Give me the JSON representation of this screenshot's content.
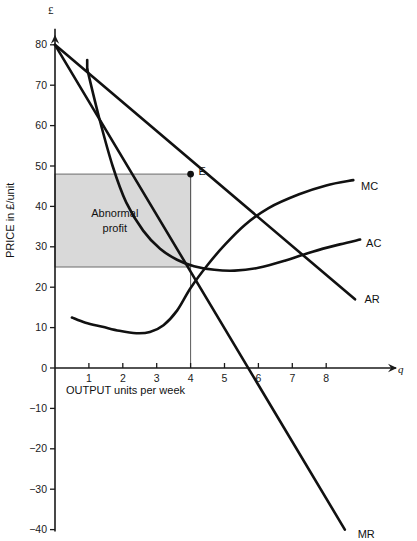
{
  "chart_data": {
    "type": "line",
    "title": "",
    "xlabel": "OUTPUT units per week",
    "ylabel": "PRICE in £/unit",
    "x_axis_symbol": "q",
    "y_axis_symbol": "£",
    "xlim": [
      0,
      9.2
    ],
    "ylim": [
      -40,
      82
    ],
    "grid": false,
    "legend_position": "right-of-curve-ends",
    "x_ticks": [
      1,
      2,
      3,
      4,
      5,
      6,
      7,
      8
    ],
    "x_tick_labels": [
      "1",
      "2",
      "3",
      "4",
      "5",
      "6",
      "7",
      "8"
    ],
    "y_ticks": [
      80,
      70,
      60,
      50,
      40,
      30,
      20,
      10,
      0,
      -10,
      -20,
      -30,
      -40
    ],
    "y_tick_labels": [
      "80",
      "70",
      "60",
      "50",
      "40",
      "30",
      "20",
      "10",
      "0",
      "−10",
      "−20",
      "−30",
      "−40"
    ],
    "series": [
      {
        "name": "AR",
        "label": "AR",
        "label_x": 8.95,
        "label_y": 17,
        "type": "line",
        "points": [
          [
            0,
            80
          ],
          [
            8.85,
            17
          ]
        ]
      },
      {
        "name": "MR",
        "label": "MR",
        "label_x": 8.75,
        "label_y": -41,
        "type": "line",
        "points": [
          [
            0,
            80
          ],
          [
            8.55,
            -40
          ]
        ]
      },
      {
        "name": "AC",
        "label": "AC",
        "label_x": 9.0,
        "label_y": 31,
        "type": "curve",
        "points": [
          [
            0.95,
            74
          ],
          [
            1.3,
            62
          ],
          [
            1.7,
            50
          ],
          [
            2.1,
            41
          ],
          [
            2.6,
            34
          ],
          [
            3.1,
            29.5
          ],
          [
            3.6,
            26.8
          ],
          [
            4.1,
            25.2
          ],
          [
            4.7,
            24.3
          ],
          [
            5.3,
            24.1
          ],
          [
            6.0,
            24.8
          ],
          [
            6.8,
            26.6
          ],
          [
            7.6,
            28.8
          ],
          [
            8.4,
            30.6
          ],
          [
            9.0,
            31.8
          ]
        ]
      },
      {
        "name": "MC",
        "label": "MC",
        "label_x": 8.85,
        "label_y": 45,
        "type": "curve",
        "points": [
          [
            0.5,
            12.5
          ],
          [
            0.9,
            11.2
          ],
          [
            1.4,
            10.2
          ],
          [
            1.9,
            9.2
          ],
          [
            2.4,
            8.6
          ],
          [
            2.8,
            8.9
          ],
          [
            3.2,
            10.6
          ],
          [
            3.6,
            14.2
          ],
          [
            4.0,
            19.8
          ],
          [
            4.5,
            25.5
          ],
          [
            5.0,
            30.4
          ],
          [
            5.6,
            35.4
          ],
          [
            6.3,
            39.6
          ],
          [
            7.2,
            43.0
          ],
          [
            8.0,
            45.2
          ],
          [
            8.8,
            46.5
          ]
        ]
      }
    ],
    "annotations": [
      {
        "name": "equilibrium-point",
        "label": "E",
        "x": 4,
        "y": 48,
        "marker": "dot"
      },
      {
        "name": "abnormal-profit-region",
        "label_line1": "Abnormal",
        "label_line2": "profit",
        "x0": 0,
        "x1": 4,
        "y0": 25,
        "y1": 48,
        "fill": "#d9d9d9"
      },
      {
        "name": "output-guideline",
        "x": 4,
        "y_from": 0,
        "y_to": 48
      }
    ],
    "colors": {
      "curve": "#111111",
      "axis": "#1a1a1a",
      "shade": "#d9d9d9",
      "guideline": "#5a5a5a",
      "text": "#111111"
    }
  }
}
